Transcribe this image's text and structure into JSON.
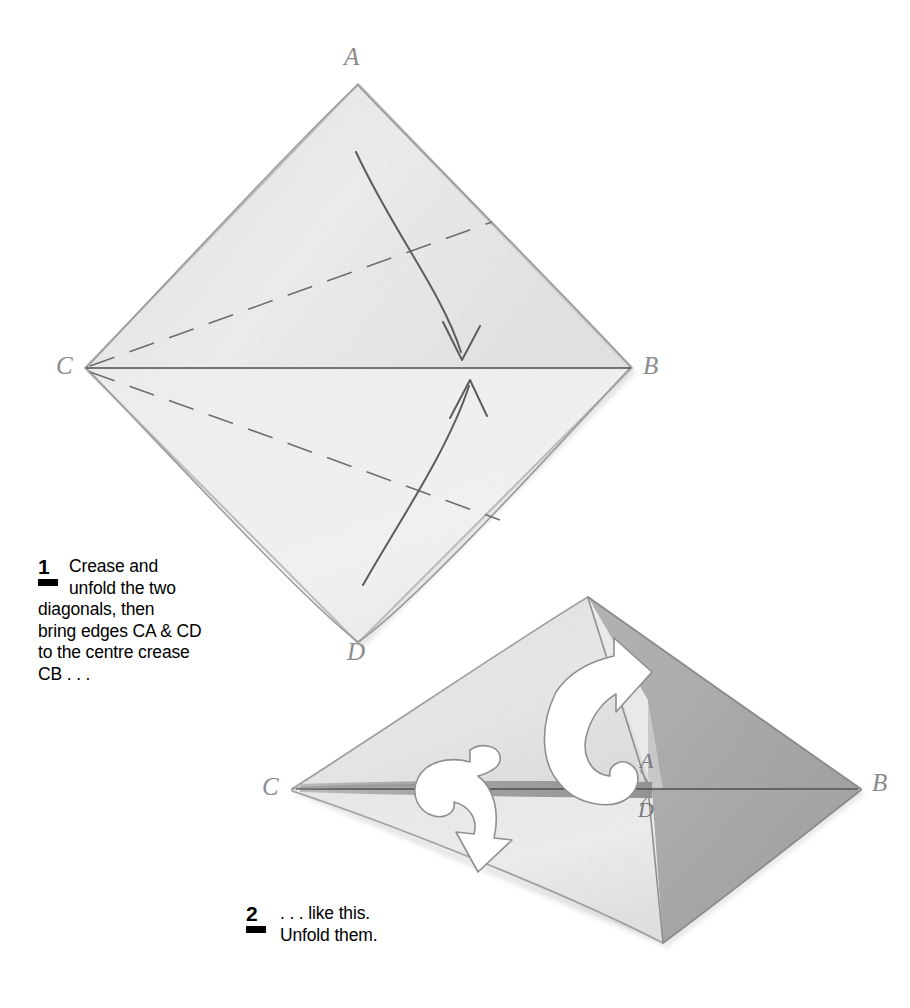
{
  "document": {
    "kind": "origami-instruction-diagram",
    "page_background": "#ffffff"
  },
  "steps": [
    {
      "id": "step-1",
      "number": "1",
      "lines": [
        "Crease and",
        "unfold the two",
        "diagonals, then",
        "bring edges CA & CD",
        "to the centre crease",
        "CB . . ."
      ],
      "full_text": "Crease and unfold the two diagonals, then bring edges CA & CD to the centre crease CB . . ."
    },
    {
      "id": "step-2",
      "number": "2",
      "lines": [
        ". . . like this.",
        "Unfold them."
      ],
      "full_text": ". . . like this. Unfold them."
    }
  ],
  "figures": [
    {
      "id": "figure-1",
      "caption_step": "1",
      "shape": "square sheet rotated 45 degrees (diamond)",
      "vertices": [
        {
          "label": "A",
          "position": "top"
        },
        {
          "label": "B",
          "position": "right"
        },
        {
          "label": "C",
          "position": "left"
        },
        {
          "label": "D",
          "position": "bottom"
        }
      ],
      "creases": [
        {
          "name": "centre-crease-CB",
          "style": "solid",
          "from": "C",
          "to": "B"
        },
        {
          "name": "diagonal-crease-upper",
          "style": "dashed",
          "from": "C",
          "to": "upper-right"
        },
        {
          "name": "diagonal-crease-lower",
          "style": "dashed",
          "from": "C",
          "to": "lower-right"
        }
      ],
      "arrows": [
        {
          "name": "fold-arrow-upper",
          "direction": "down-to-centre",
          "style": "thin-pencil-curve"
        },
        {
          "name": "fold-arrow-lower",
          "direction": "up-to-centre",
          "style": "thin-pencil-curve"
        }
      ]
    },
    {
      "id": "figure-2",
      "caption_step": "2",
      "shape": "kite / folded dart with edges CA and CD brought to crease CB",
      "vertices": [
        {
          "label": "C",
          "position": "left-point"
        },
        {
          "label": "B",
          "position": "right-point"
        },
        {
          "label": "A",
          "position": "centre-above-crease"
        },
        {
          "label": "D",
          "position": "centre-below-crease"
        }
      ],
      "arrows": [
        {
          "name": "unfold-arrow-up",
          "direction": "up",
          "style": "white-hooked-arrow"
        },
        {
          "name": "unfold-arrow-down",
          "direction": "down",
          "style": "white-hooked-arrow"
        }
      ]
    }
  ],
  "colors": {
    "paper_light": "#ececec",
    "paper_mid": "#dcdcdc",
    "paper_dark": "#a9a9a9",
    "pencil_line": "#5a5a5a",
    "label_grey": "#8b8b8b",
    "text_black": "#000000",
    "page_white": "#ffffff"
  }
}
